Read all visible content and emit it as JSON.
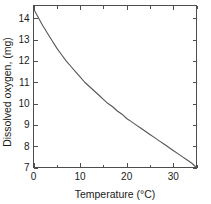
{
  "chart_data": {
    "type": "line",
    "title": "",
    "xlabel": "Temperature (°C)",
    "ylabel": "Dissolved oxygen, (mg)",
    "xlim": [
      0,
      35
    ],
    "ylim": [
      7,
      14.6
    ],
    "grid": false,
    "legend": null,
    "x_major_ticks": [
      0,
      10,
      20,
      30
    ],
    "x_minor_ticks": [
      5,
      15,
      25,
      35
    ],
    "x_tick_labels": [
      "0",
      "10",
      "20",
      "30"
    ],
    "y_major_ticks": [
      7,
      8,
      9,
      10,
      11,
      12,
      13,
      14
    ],
    "y_tick_labels": [
      "7",
      "8",
      "9",
      "10",
      "11",
      "12",
      "13",
      "14"
    ],
    "series": [
      {
        "name": "Dissolved oxygen saturation",
        "x": [
          0,
          1,
          2,
          3,
          4,
          5,
          6,
          7,
          8,
          9,
          10,
          11,
          12,
          13,
          14,
          15,
          16,
          17,
          18,
          19,
          20,
          21,
          22,
          23,
          24,
          25,
          26,
          27,
          28,
          29,
          30,
          31,
          32,
          33,
          34,
          35
        ],
        "values": [
          14.45,
          14.05,
          13.65,
          13.3,
          12.95,
          12.6,
          12.3,
          12.0,
          11.75,
          11.5,
          11.25,
          11.0,
          10.8,
          10.6,
          10.4,
          10.2,
          10.0,
          9.85,
          9.65,
          9.5,
          9.3,
          9.15,
          9.0,
          8.85,
          8.7,
          8.55,
          8.4,
          8.25,
          8.1,
          7.95,
          7.8,
          7.65,
          7.5,
          7.35,
          7.2,
          7.0
        ],
        "color": "#555555"
      }
    ]
  },
  "axes": {
    "frame_color": "#4d4d4d"
  }
}
